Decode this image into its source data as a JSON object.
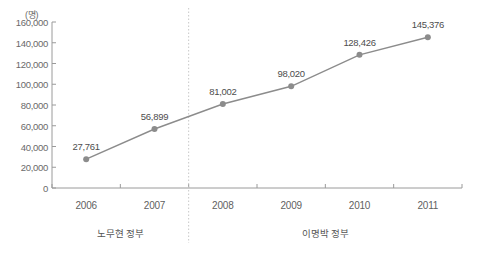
{
  "chart_data": {
    "type": "line",
    "title": "",
    "subtitle": "",
    "xlabel": "",
    "ylabel": "",
    "unit_label": "(명)",
    "categories": [
      "2006",
      "2007",
      "2008",
      "2009",
      "2010",
      "2011"
    ],
    "values": [
      27761,
      56899,
      81002,
      98020,
      128426,
      145376
    ],
    "point_labels": [
      "27,761",
      "56,899",
      "81,002",
      "98,020",
      "128,426",
      "145,376"
    ],
    "ylim": [
      0,
      160000
    ],
    "y_ticks": [
      0,
      20000,
      40000,
      60000,
      80000,
      100000,
      120000,
      140000,
      160000
    ],
    "y_tick_labels": [
      "0",
      "20,000",
      "40,000",
      "60,000",
      "80,000",
      "100,000",
      "120,000",
      "140,000",
      "160,000"
    ],
    "grid": false,
    "legend": "none",
    "series": [
      {
        "name": "",
        "values": [
          27761,
          56899,
          81002,
          98020,
          128426,
          145376
        ],
        "color": "#8c8c8c",
        "marker": "circle"
      }
    ],
    "annotations": [
      {
        "name": "period-roh",
        "text": "노무현 정부",
        "span": [
          "2006",
          "2007"
        ]
      },
      {
        "name": "period-lee",
        "text": "이명박 정부",
        "span": [
          "2008",
          "2011"
        ]
      }
    ],
    "divider": {
      "name": "government-divider",
      "style": "dotted",
      "between": [
        "2007",
        "2008"
      ],
      "color": "#c8c8c8"
    },
    "colors": {
      "line": "#8c8c8c",
      "marker": "#8c8c8c",
      "axis": "#9a9a9a",
      "text": "#5a5a5a",
      "divider": "#c8c8c8",
      "background": "#ffffff"
    }
  }
}
